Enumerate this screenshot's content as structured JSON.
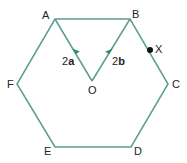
{
  "diagram": {
    "type": "regular-hexagon-vectors",
    "line_color": "#5a9e8c",
    "point_color": "#111111",
    "vertices": {
      "A": {
        "label": "A",
        "x": 55,
        "y": 19
      },
      "B": {
        "label": "B",
        "x": 130,
        "y": 19
      },
      "C": {
        "label": "C",
        "x": 168,
        "y": 84
      },
      "D": {
        "label": "D",
        "x": 131,
        "y": 147
      },
      "E": {
        "label": "E",
        "x": 55,
        "y": 147
      },
      "F": {
        "label": "F",
        "x": 17,
        "y": 84
      }
    },
    "center": {
      "label": "O",
      "x": 92,
      "y": 81
    },
    "point_x": {
      "label": "X",
      "x": 150,
      "y": 50,
      "on_segment": "BC"
    },
    "vectors": [
      {
        "from": "O",
        "to": "A",
        "label_coef": "2",
        "label_vec": "a"
      },
      {
        "from": "O",
        "to": "B",
        "label_coef": "2",
        "label_vec": "b"
      }
    ]
  }
}
